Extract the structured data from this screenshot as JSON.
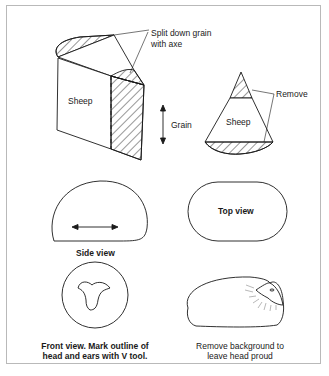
{
  "figure": {
    "labels": {
      "split_note_line1": "Split down grain",
      "split_note_line2": "with axe",
      "sheep_block": "Sheep",
      "grain": "Grain",
      "remove": "Remove",
      "sheep_cone": "Sheep",
      "side_view": "Side view",
      "top_view": "Top view",
      "front_view_line1": "Front view. Mark outline of",
      "front_view_line2": "head and ears with V tool.",
      "background_line1": "Remove background to",
      "background_line2": "leave head proud"
    },
    "colors": {
      "stroke": "#1a1a1a",
      "frame": "#b9b9b9",
      "background": "#ffffff"
    }
  }
}
